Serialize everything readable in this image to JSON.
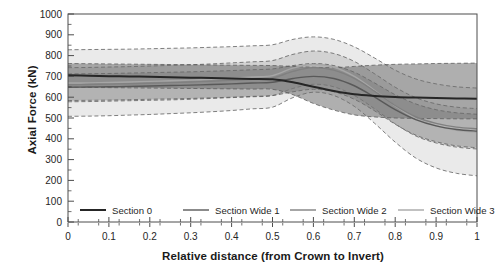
{
  "chart_data": {
    "type": "line",
    "title": "",
    "xlabel": "Relative distance (from Crown to Invert)",
    "ylabel": "Axial Force (kN)",
    "xlim": [
      0,
      1
    ],
    "ylim": [
      0,
      1000
    ],
    "xticks": [
      "0",
      "0.1",
      "0.2",
      "0.3",
      "0.4",
      "0.5",
      "0.6",
      "0.7",
      "0.8",
      "0.9",
      "1"
    ],
    "xtick_values": [
      0,
      0.1,
      0.2,
      0.3,
      0.4,
      0.5,
      0.6,
      0.7,
      0.8,
      0.9,
      1
    ],
    "yticks": [
      "0",
      "100",
      "200",
      "300",
      "400",
      "500",
      "600",
      "700",
      "800",
      "900",
      "1000"
    ],
    "ytick_values": [
      0,
      100,
      200,
      300,
      400,
      500,
      600,
      700,
      800,
      900,
      1000
    ],
    "grid": false,
    "legend_position": "inside-bottom",
    "x": [
      0,
      0.05,
      0.1,
      0.15,
      0.2,
      0.25,
      0.3,
      0.35,
      0.4,
      0.45,
      0.5,
      0.55,
      0.6,
      0.65,
      0.7,
      0.75,
      0.8,
      0.85,
      0.9,
      0.95,
      1
    ],
    "series": [
      {
        "name": "Section 0",
        "color": "#262626",
        "width": 2.0,
        "values": [
          705,
          703,
          701,
          700,
          698,
          696,
          694,
          692,
          690,
          688,
          686,
          672,
          650,
          630,
          614,
          606,
          601,
          598,
          596,
          594,
          592
        ],
        "band_upper": [
          762,
          761,
          760,
          759,
          758,
          757,
          756,
          755,
          754,
          753,
          752,
          748,
          744,
          742,
          748,
          754,
          758,
          760,
          762,
          763,
          764
        ],
        "band_lower": [
          648,
          647,
          646,
          645,
          644,
          643,
          642,
          641,
          640,
          639,
          638,
          612,
          570,
          538,
          515,
          505,
          500,
          498,
          497,
          496,
          496
        ]
      },
      {
        "name": "Section Wide 1",
        "color": "#595959",
        "width": 1.4,
        "values": [
          648,
          649,
          650,
          652,
          654,
          656,
          658,
          661,
          664,
          668,
          672,
          690,
          700,
          690,
          655,
          600,
          540,
          492,
          462,
          445,
          437
        ],
        "band_upper": [
          712,
          713,
          714,
          716,
          718,
          720,
          722,
          725,
          728,
          732,
          736,
          752,
          762,
          752,
          720,
          668,
          612,
          568,
          540,
          525,
          518
        ],
        "band_lower": [
          584,
          585,
          586,
          588,
          590,
          592,
          594,
          597,
          600,
          604,
          608,
          626,
          638,
          626,
          590,
          534,
          470,
          418,
          386,
          366,
          357
        ]
      },
      {
        "name": "Section Wide 2",
        "color": "#808080",
        "width": 1.4,
        "values": [
          660,
          661,
          663,
          665,
          667,
          670,
          673,
          677,
          681,
          686,
          692,
          724,
          742,
          730,
          690,
          628,
          560,
          506,
          474,
          456,
          448
        ],
        "band_upper": [
          742,
          743,
          745,
          747,
          750,
          753,
          756,
          760,
          765,
          770,
          776,
          806,
          822,
          810,
          772,
          712,
          648,
          598,
          568,
          552,
          545
        ],
        "band_lower": [
          578,
          579,
          581,
          583,
          585,
          587,
          590,
          594,
          598,
          602,
          608,
          642,
          662,
          650,
          608,
          544,
          472,
          414,
          380,
          360,
          351
        ]
      },
      {
        "name": "Section Wide 3",
        "color": "#a6a6a6",
        "width": 1.4,
        "values": [
          668,
          669,
          671,
          673,
          676,
          679,
          682,
          686,
          691,
          697,
          704,
          740,
          758,
          744,
          700,
          632,
          558,
          498,
          462,
          441,
          432
        ],
        "band_upper": [
          828,
          829,
          830,
          831,
          833,
          835,
          837,
          840,
          843,
          847,
          852,
          878,
          890,
          878,
          842,
          788,
          730,
          688,
          664,
          650,
          644
        ],
        "band_lower": [
          508,
          509,
          511,
          514,
          517,
          521,
          525,
          530,
          536,
          544,
          552,
          598,
          624,
          608,
          556,
          474,
          384,
          308,
          260,
          234,
          222
        ]
      }
    ]
  },
  "legend": {
    "items": [
      {
        "label": "Section 0"
      },
      {
        "label": "Section Wide 1"
      },
      {
        "label": "Section Wide 2"
      },
      {
        "label": "Section Wide 3"
      }
    ]
  },
  "axes": {
    "frame_color": "#4d4d4d",
    "background": "#ffffff"
  }
}
